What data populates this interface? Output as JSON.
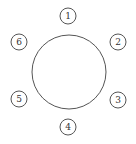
{
  "diagram": {
    "table": {
      "cx": 69,
      "cy": 72,
      "r": 37,
      "stroke": "#555555"
    },
    "seats": [
      {
        "label": "1",
        "cx": 68,
        "cy": 16
      },
      {
        "label": "2",
        "cx": 118,
        "cy": 42
      },
      {
        "label": "3",
        "cx": 118,
        "cy": 100
      },
      {
        "label": "4",
        "cx": 68,
        "cy": 127
      },
      {
        "label": "5",
        "cx": 19,
        "cy": 99
      },
      {
        "label": "6",
        "cx": 19,
        "cy": 42
      }
    ],
    "seat_radius": 8
  }
}
